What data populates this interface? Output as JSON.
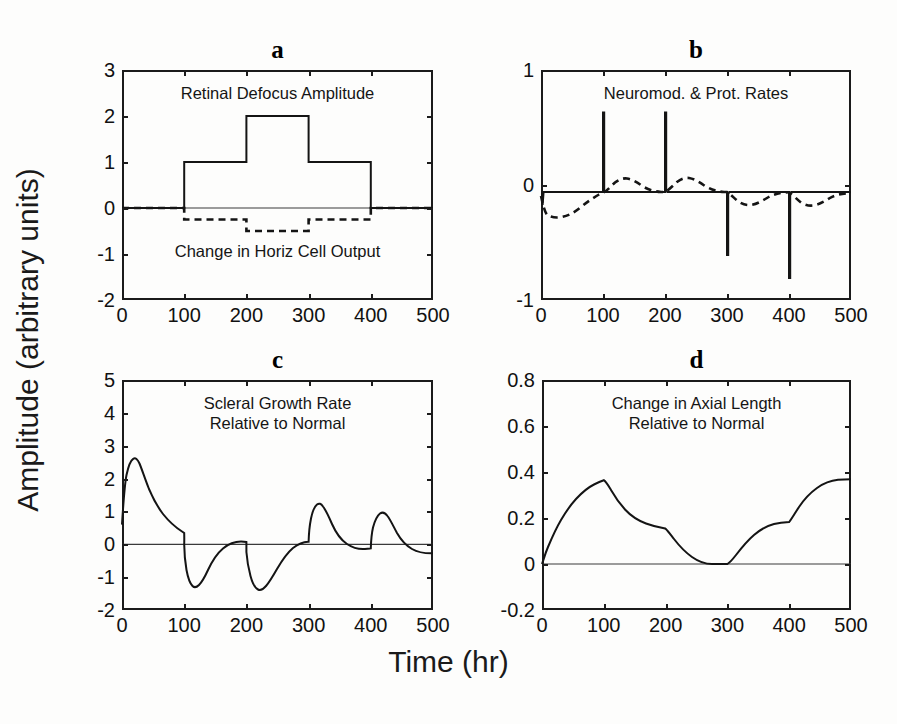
{
  "figure": {
    "ylabel": "Amplitude (arbitrary units)",
    "xlabel": "Time (hr)"
  },
  "chart_data": [
    {
      "type": "line",
      "panel": "a",
      "title": "Retinal Defocus Amplitude",
      "secondary_title": "Change in Horiz Cell Output",
      "xlabel": "Time (hr)",
      "ylabel": "Amplitude (arbitrary units)",
      "xlim": [
        0,
        500
      ],
      "ylim": [
        -2,
        3
      ],
      "xticks": [
        0,
        100,
        200,
        300,
        400,
        500
      ],
      "yticks": [
        -2,
        -1,
        0,
        1,
        2,
        3
      ],
      "grid": false,
      "legend": "none",
      "series": [
        {
          "name": "Retinal Defocus Amplitude",
          "style": "solid",
          "x": [
            0,
            100,
            100,
            200,
            200,
            300,
            300,
            400,
            400,
            500
          ],
          "values": [
            0,
            0,
            1,
            1,
            2,
            2,
            1,
            1,
            0,
            0
          ]
        },
        {
          "name": "Change in Horiz Cell Output",
          "style": "dashed",
          "x": [
            0,
            100,
            100,
            200,
            200,
            300,
            300,
            400,
            400,
            500
          ],
          "values": [
            0,
            0,
            -0.25,
            -0.25,
            -0.5,
            -0.5,
            -0.25,
            -0.25,
            0,
            0
          ]
        }
      ]
    },
    {
      "type": "line",
      "panel": "b",
      "title": "Neuromod. & Prot. Rates",
      "xlabel": "Time (hr)",
      "ylabel": "Amplitude (arbitrary units)",
      "xlim": [
        0,
        500
      ],
      "ylim": [
        -1,
        1
      ],
      "xticks": [
        0,
        100,
        200,
        300,
        400,
        500
      ],
      "yticks": [
        -1,
        0,
        1
      ],
      "grid": false,
      "legend": "none",
      "series": [
        {
          "name": "Neuromodulator rate",
          "style": "solid",
          "description": "Sharp transient spikes at each defocus step change",
          "spikes": [
            {
              "t": 2,
              "peak": -0.08
            },
            {
              "t": 100,
              "peak": 0.72
            },
            {
              "t": 200,
              "peak": 0.72
            },
            {
              "t": 300,
              "peak": -0.55
            },
            {
              "t": 400,
              "peak": -0.75
            }
          ],
          "baseline": 0
        },
        {
          "name": "Protein synthesis rate",
          "style": "dashed",
          "description": "Smooth low-pass response, decays back to zero",
          "x": [
            0,
            10,
            25,
            40,
            60,
            80,
            95,
            100,
            110,
            120,
            140,
            160,
            185,
            200,
            210,
            220,
            240,
            260,
            285,
            300,
            310,
            325,
            350,
            375,
            400,
            410,
            425,
            450,
            480,
            500
          ],
          "values": [
            -0.05,
            -0.2,
            -0.22,
            -0.18,
            -0.11,
            -0.05,
            -0.02,
            -0.01,
            0.07,
            0.14,
            0.12,
            0.07,
            0.03,
            0.02,
            0.09,
            0.15,
            0.13,
            0.08,
            0.03,
            0.0,
            -0.07,
            -0.12,
            -0.09,
            -0.05,
            -0.03,
            -0.09,
            -0.12,
            -0.08,
            -0.03,
            -0.01
          ]
        }
      ]
    },
    {
      "type": "line",
      "panel": "c",
      "title": "Scleral Growth Rate",
      "title_line2": "Relative to Normal",
      "xlabel": "Time (hr)",
      "ylabel": "Amplitude (arbitrary units)",
      "xlim": [
        0,
        500
      ],
      "ylim": [
        -2,
        5
      ],
      "xticks": [
        0,
        100,
        200,
        300,
        400,
        500
      ],
      "yticks": [
        -2,
        -1,
        0,
        1,
        2,
        3,
        4,
        5
      ],
      "grid": false,
      "legend": "none",
      "series": [
        {
          "name": "Scleral Growth Rate Relative to Normal",
          "style": "solid",
          "x": [
            0,
            5,
            10,
            15,
            18,
            22,
            28,
            35,
            45,
            55,
            65,
            75,
            85,
            95,
            100,
            102,
            106,
            110,
            114,
            118,
            125,
            135,
            148,
            162,
            178,
            192,
            199,
            200,
            203,
            207,
            211,
            215,
            220,
            230,
            245,
            262,
            280,
            295,
            300,
            302,
            306,
            310,
            314,
            318,
            325,
            335,
            350,
            368,
            388,
            399,
            400,
            403,
            407,
            411,
            415,
            420,
            430,
            445,
            462,
            482,
            500
          ],
          "values": [
            0.6,
            1.6,
            2.45,
            2.72,
            2.75,
            2.6,
            2.3,
            1.95,
            1.5,
            1.15,
            0.9,
            0.7,
            0.5,
            0.35,
            0.25,
            -0.35,
            -1.0,
            -1.3,
            -1.38,
            -1.35,
            -1.2,
            -1.0,
            -0.78,
            -0.55,
            -0.35,
            -0.22,
            -0.18,
            -0.5,
            -1.0,
            -1.3,
            -1.4,
            -1.38,
            -1.28,
            -1.05,
            -0.75,
            -0.5,
            -0.28,
            -0.12,
            -0.05,
            0.55,
            1.1,
            1.3,
            1.35,
            1.3,
            1.12,
            0.88,
            0.6,
            0.35,
            0.15,
            0.05,
            0.35,
            0.95,
            1.3,
            1.4,
            1.38,
            1.28,
            1.0,
            0.68,
            0.4,
            0.18,
            0.07
          ]
        }
      ]
    },
    {
      "type": "line",
      "panel": "d",
      "title": "Change in Axial Length",
      "title_line2": "Relative to Normal",
      "xlabel": "Time (hr)",
      "ylabel": "Amplitude (arbitrary units)",
      "xlim": [
        0,
        500
      ],
      "ylim": [
        -0.2,
        0.8
      ],
      "xticks": [
        0,
        100,
        200,
        300,
        400,
        500
      ],
      "yticks": [
        -0.2,
        0,
        0.2,
        0.4,
        0.6,
        0.8
      ],
      "grid": false,
      "legend": "none",
      "series": [
        {
          "name": "Change in Axial Length Relative to Normal",
          "style": "solid",
          "x": [
            0,
            10,
            20,
            30,
            40,
            55,
            70,
            85,
            95,
            100,
            105,
            115,
            130,
            150,
            170,
            190,
            200,
            205,
            215,
            230,
            250,
            270,
            285,
            295,
            300,
            305,
            312,
            322,
            338,
            358,
            378,
            392,
            400,
            405,
            415,
            430,
            450,
            470,
            485,
            500
          ],
          "values": [
            0.0,
            0.06,
            0.13,
            0.19,
            0.24,
            0.3,
            0.35,
            0.385,
            0.397,
            0.4,
            0.395,
            0.355,
            0.3,
            0.255,
            0.225,
            0.205,
            0.198,
            0.185,
            0.155,
            0.115,
            0.06,
            0.02,
            0.005,
            0.0,
            0.0,
            0.015,
            0.05,
            0.1,
            0.145,
            0.175,
            0.192,
            0.197,
            0.198,
            0.215,
            0.26,
            0.315,
            0.365,
            0.39,
            0.398,
            0.4
          ]
        }
      ]
    }
  ],
  "panels": [
    {
      "letter": "a",
      "title": "Retinal Defocus Amplitude",
      "title2": "Change in Horiz Cell Output",
      "yticks": [
        "3",
        "2",
        "1",
        "0",
        "-1",
        "-2"
      ],
      "xticks": [
        "0",
        "100",
        "200",
        "300",
        "400",
        "500"
      ]
    },
    {
      "letter": "b",
      "title": "Neuromod. & Prot. Rates",
      "yticks": [
        "1",
        "0",
        "-1"
      ],
      "xticks": [
        "0",
        "100",
        "200",
        "300",
        "400",
        "500"
      ]
    },
    {
      "letter": "c",
      "title": "Scleral Growth Rate",
      "title2": "Relative to Normal",
      "yticks": [
        "5",
        "4",
        "3",
        "2",
        "1",
        "0",
        "-1",
        "-2"
      ],
      "xticks": [
        "0",
        "100",
        "200",
        "300",
        "400",
        "500"
      ]
    },
    {
      "letter": "d",
      "title": "Change in Axial Length",
      "title2": "Relative to Normal",
      "yticks": [
        "0.8",
        "0.6",
        "0.4",
        "0.2",
        "0",
        "-0.2"
      ],
      "xticks": [
        "0",
        "100",
        "200",
        "300",
        "400",
        "500"
      ]
    }
  ]
}
